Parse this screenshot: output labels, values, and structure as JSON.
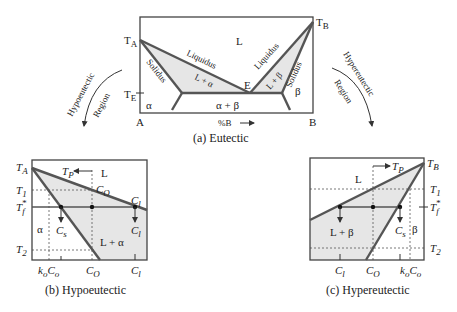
{
  "diagram_a": {
    "caption": "(a) Eutectic",
    "labels": {
      "TA": "T",
      "TA_sub": "A",
      "TB": "T",
      "TB_sub": "B",
      "TE": "T",
      "TE_sub": "E",
      "L": "L",
      "liquidus_left": "Liquidus",
      "liquidus_right": "Liquidus",
      "solidus_left": "Solidus",
      "solidus_right": "Solidus",
      "L_alpha": "L + α",
      "L_beta": "L + β",
      "E": "E",
      "alpha": "α",
      "beta": "β",
      "alpha_beta": "α + β",
      "A": "A",
      "B": "B",
      "axis": "%B"
    }
  },
  "side_labels": {
    "hypo_line1": "Hypoeutectic",
    "hypo_line2": "Region",
    "hyper_line1": "Hypereutectic",
    "hyper_line2": "Region"
  },
  "diagram_b": {
    "caption": "(b) Hypoeutectic",
    "labels": {
      "TA": "T",
      "TA_sub": "A",
      "T1": "T",
      "T1_sub": "1",
      "Tf": "T",
      "Tf_sub": "f",
      "Tf_sup": "*",
      "T2": "T",
      "T2_sub": "2",
      "Tp": "T",
      "Tp_sub": "P",
      "L": "L",
      "Co": "C",
      "Co_sub": "O",
      "Cl": "C",
      "Cl_sub": "l",
      "Cs": "C",
      "Cs_sub": "s",
      "alpha": "α",
      "L_alpha": "L + α",
      "x_koCo": "k",
      "x_koCo_sub": "o",
      "x_koCo_b": "C",
      "x_koCo_sub2": "o",
      "x_Co": "C",
      "x_Co_sub": "O",
      "x_Cl": "C",
      "x_Cl_sub": "l"
    }
  },
  "diagram_c": {
    "caption": "(c) Hypereutectic",
    "labels": {
      "TB": "T",
      "TB_sub": "B",
      "T1": "T",
      "T1_sub": "1",
      "Tf": "T",
      "Tf_sub": "f",
      "Tf_sup": "*",
      "T2": "T",
      "T2_sub": "2",
      "Tp": "T",
      "Tp_sub": "P",
      "L": "L",
      "Cs": "C",
      "Cs_sub": "s",
      "beta": "β",
      "L_beta": "L + β",
      "x_Cl": "C",
      "x_Cl_sub": "l",
      "x_Co": "C",
      "x_Co_sub": "O",
      "x_koCo": "k",
      "x_koCo_sub": "o",
      "x_koCo_b": "C",
      "x_koCo_sub2": "o"
    }
  },
  "colors": {
    "shade": "#e6e6e6",
    "line": "#555555",
    "text": "#222222"
  }
}
